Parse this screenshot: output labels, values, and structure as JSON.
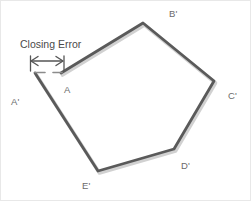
{
  "figure": {
    "width": 251,
    "height": 201,
    "background_color": "#ffffff",
    "border_color": "#e8e8e8"
  },
  "annotations": {
    "closing_error_label": "Closing Error",
    "arrow": {
      "name": "double-headed-arrow",
      "direction": "horizontal-both",
      "color": "#555555",
      "x_start": 29,
      "x_end": 63,
      "y": 60
    },
    "extension_lines": {
      "color": "#555555",
      "left_x": 29,
      "right_x": 63,
      "y_top": 55,
      "y_bottom": 72
    }
  },
  "traverse": {
    "line_color": "#5a5a5a",
    "shadow_color": "#c9c9c9",
    "line_width": 3,
    "closed": false,
    "description": "Open traverse showing closing error gap between A and A-prime",
    "vertices": [
      {
        "id": "A",
        "label": "A",
        "x": 60,
        "y": 72,
        "tick": true
      },
      {
        "id": "B'",
        "label": "B'",
        "x": 142,
        "y": 22,
        "tick": false
      },
      {
        "id": "C'",
        "label": "C'",
        "x": 213,
        "y": 80,
        "tick": false
      },
      {
        "id": "D'",
        "label": "D'",
        "x": 173,
        "y": 148,
        "tick": false
      },
      {
        "id": "E'",
        "label": "E'",
        "x": 97,
        "y": 170,
        "tick": false
      },
      {
        "id": "A'",
        "label": "A'",
        "x": 34,
        "y": 72,
        "tick": true
      }
    ],
    "segments": [
      {
        "from": "A",
        "to": "B'"
      },
      {
        "from": "B'",
        "to": "C'"
      },
      {
        "from": "C'",
        "to": "D'"
      },
      {
        "from": "D'",
        "to": "E'"
      },
      {
        "from": "E'",
        "to": "A'"
      }
    ],
    "gap_segment": {
      "from": "A'",
      "to": "A",
      "meaning": "Closing Error"
    }
  },
  "labels": {
    "A": "A",
    "A_prime": "A'",
    "B_prime": "B'",
    "C_prime": "C'",
    "D_prime": "D'",
    "E_prime": "E'"
  }
}
